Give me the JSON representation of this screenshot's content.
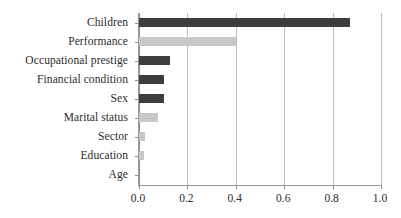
{
  "chart_data": {
    "type": "bar",
    "orientation": "horizontal",
    "title": "",
    "subtitle": "",
    "xlabel": "",
    "ylabel": "",
    "categories": [
      "Children",
      "Performance",
      "Occupational prestige",
      "Financial condition",
      "Sex",
      "Marital status",
      "Sector",
      "Education",
      "Age"
    ],
    "values": [
      0.87,
      0.4,
      0.13,
      0.105,
      0.105,
      0.08,
      0.025,
      0.02,
      0.0
    ],
    "bar_colors": [
      "#3d3d3d",
      "#c8c8c8",
      "#3d3d3d",
      "#3d3d3d",
      "#3d3d3d",
      "#c8c8c8",
      "#c8c8c8",
      "#c8c8c8",
      "#c8c8c8"
    ],
    "xlim": [
      0.0,
      1.0
    ],
    "xticks": [
      0.0,
      0.2,
      0.4,
      0.6,
      0.8,
      1.0
    ],
    "xtick_labels": [
      "0.0",
      "0.2",
      "0.4",
      "0.6",
      "0.8",
      "1.0"
    ],
    "grid": "vertical",
    "legend": null,
    "annotations": []
  },
  "style": {
    "dark_bar_color": "#3d3d3d",
    "light_bar_color": "#c8c8c8",
    "gridline_color": "#bdbdbd",
    "axis_color": "#8f8f8f",
    "text_color": "#2b2b2b",
    "background": "#ffffff"
  }
}
